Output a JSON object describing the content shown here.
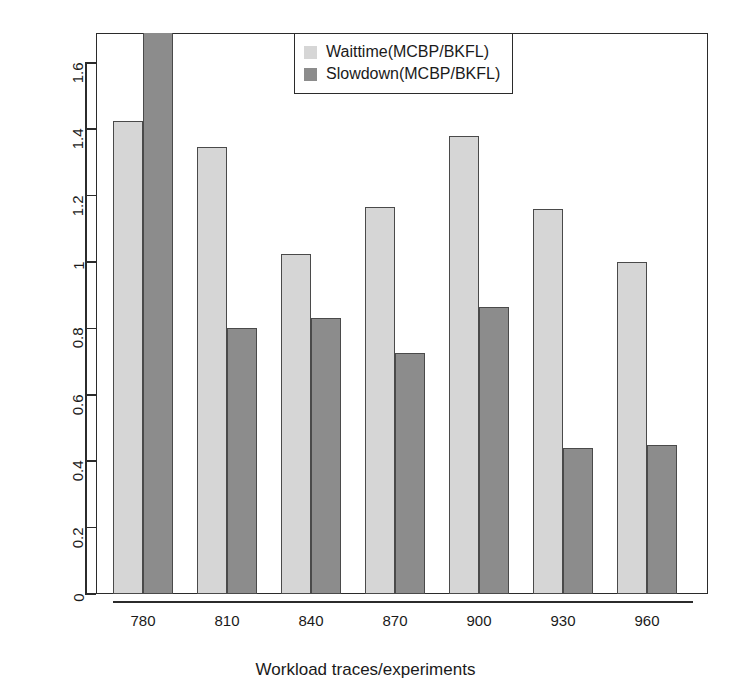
{
  "chart_data": {
    "type": "bar",
    "title": "",
    "xlabel": "Workload traces/experiments",
    "ylabel": "Normalized waittime, slowdown metrics",
    "categories": [
      "780",
      "810",
      "840",
      "870",
      "900",
      "930",
      "960"
    ],
    "series": [
      {
        "name": "Waittime(MCBP/BKFL)",
        "color": "#d6d6d6",
        "values": [
          1.425,
          1.345,
          1.025,
          1.165,
          1.38,
          1.16,
          1.0
        ]
      },
      {
        "name": "Slowdown(MCBP/BKFL)",
        "color": "#8c8c8c",
        "values": [
          1.72,
          0.8,
          0.83,
          0.725,
          0.865,
          0.44,
          0.45
        ]
      }
    ],
    "ylim": [
      0,
      1.69
    ],
    "yticks": [
      "0",
      "0.2",
      "0.4",
      "0.6",
      "0.8",
      "1",
      "1.2",
      "1.4",
      "1.6"
    ],
    "ytick_values": [
      0,
      0.2,
      0.4,
      0.6,
      0.8,
      1,
      1.2,
      1.4,
      1.6
    ],
    "grid": false,
    "legend_position": "top-center",
    "note_clipped_bar": "First Slowdown bar (780) extends beyond the top of the plot area"
  },
  "legend": {
    "entries": [
      {
        "label": "Waittime(MCBP/BKFL)"
      },
      {
        "label": "Slowdown(MCBP/BKFL)"
      }
    ]
  }
}
